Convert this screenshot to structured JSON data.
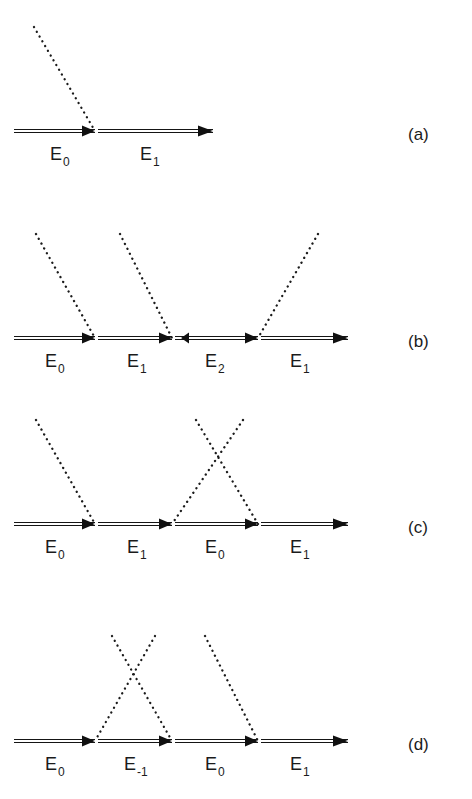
{
  "figure": {
    "width": 472,
    "height": 799,
    "background_color": "#ffffff",
    "ink_color": "#1b1b1b",
    "line_style": {
      "particle_line": "double-solid-with-filled-arrowheads",
      "interaction_line": "dotted"
    }
  },
  "panels": [
    {
      "id": "a",
      "tag": "(a)",
      "baseline_y": 131,
      "x_start": 14,
      "x_end": 213,
      "vertices": [
        95
      ],
      "segments": [
        {
          "label": "E",
          "sub": "0",
          "label_x": 50,
          "label_y": 160,
          "direction": "right"
        },
        {
          "label": "E",
          "sub": "1",
          "label_x": 140,
          "label_y": 160,
          "direction": "right"
        }
      ],
      "photons": [
        {
          "x1": 34,
          "y1": 27,
          "x2": 95,
          "y2": 131,
          "sense": "incoming-from-upper-left"
        }
      ]
    },
    {
      "id": "b",
      "tag": "(b)",
      "baseline_y": 338,
      "x_start": 14,
      "x_end": 348,
      "vertices": [
        95,
        172,
        258
      ],
      "segments": [
        {
          "label": "E",
          "sub": "0",
          "label_x": 45,
          "label_y": 367,
          "direction": "right"
        },
        {
          "label": "E",
          "sub": "1",
          "label_x": 127,
          "label_y": 367,
          "direction": "right"
        },
        {
          "label": "E",
          "sub": "2",
          "label_x": 205,
          "label_y": 367,
          "direction": "left"
        },
        {
          "label": "E",
          "sub": "1",
          "label_x": 290,
          "label_y": 367,
          "direction": "right"
        }
      ],
      "photons": [
        {
          "x1": 36,
          "y1": 234,
          "x2": 95,
          "y2": 338,
          "sense": "incoming-from-upper-left"
        },
        {
          "x1": 120,
          "y1": 234,
          "x2": 172,
          "y2": 338,
          "sense": "incoming-from-upper-left"
        },
        {
          "x1": 318,
          "y1": 234,
          "x2": 258,
          "y2": 338,
          "sense": "outgoing-to-upper-right"
        }
      ]
    },
    {
      "id": "c",
      "tag": "(c)",
      "baseline_y": 524,
      "x_start": 14,
      "x_end": 348,
      "vertices": [
        95,
        172,
        258
      ],
      "segments": [
        {
          "label": "E",
          "sub": "0",
          "label_x": 45,
          "label_y": 553,
          "direction": "right"
        },
        {
          "label": "E",
          "sub": "1",
          "label_x": 127,
          "label_y": 553,
          "direction": "right"
        },
        {
          "label": "E",
          "sub": "0",
          "label_x": 205,
          "label_y": 553,
          "direction": "right"
        },
        {
          "label": "E",
          "sub": "1",
          "label_x": 290,
          "label_y": 553,
          "direction": "right"
        }
      ],
      "photons": [
        {
          "x1": 36,
          "y1": 420,
          "x2": 95,
          "y2": 524,
          "sense": "incoming-from-upper-left"
        },
        {
          "x1": 243,
          "y1": 420,
          "x2": 172,
          "y2": 524,
          "sense": "incoming-from-upper-right"
        },
        {
          "x1": 196,
          "y1": 420,
          "x2": 258,
          "y2": 524,
          "sense": "outgoing-to-upper-right"
        }
      ]
    },
    {
      "id": "d",
      "tag": "(d)",
      "baseline_y": 741,
      "x_start": 14,
      "x_end": 348,
      "vertices": [
        95,
        172,
        258
      ],
      "segments": [
        {
          "label": "E",
          "sub": "0",
          "label_x": 45,
          "label_y": 770,
          "direction": "right"
        },
        {
          "label": "E",
          "sub": "-1",
          "label_x": 124,
          "label_y": 770,
          "direction": "right"
        },
        {
          "label": "E",
          "sub": "0",
          "label_x": 205,
          "label_y": 770,
          "direction": "right"
        },
        {
          "label": "E",
          "sub": "1",
          "label_x": 290,
          "label_y": 770,
          "direction": "right"
        }
      ],
      "photons": [
        {
          "x1": 155,
          "y1": 636,
          "x2": 95,
          "y2": 741,
          "sense": "incoming-from-upper-right"
        },
        {
          "x1": 112,
          "y1": 636,
          "x2": 172,
          "y2": 741,
          "sense": "outgoing-to-upper-right"
        },
        {
          "x1": 205,
          "y1": 636,
          "x2": 258,
          "y2": 741,
          "sense": "outgoing-to-upper-right"
        }
      ]
    }
  ],
  "panel_tag_x": 408,
  "panel_tag_offsets": {
    "a": 140,
    "b": 347,
    "c": 533,
    "d": 750
  }
}
